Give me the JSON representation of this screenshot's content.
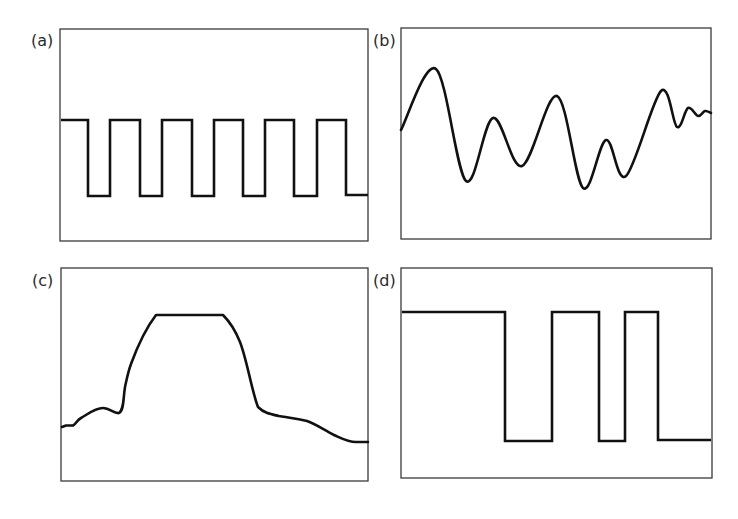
{
  "figure": {
    "colors": {
      "frame": "#3a3a3a",
      "wave": "#111111",
      "background": "#ffffff"
    },
    "panels": [
      {
        "id": "a",
        "label": "(a)",
        "description": "Regular square wave (periodic pulse train)",
        "box": {
          "x": 60,
          "y": 29,
          "w": 308,
          "h": 212
        },
        "label_pos": {
          "x": 31,
          "y": 46
        },
        "style": "step",
        "points": [
          [
            61,
            120
          ],
          [
            88,
            120
          ],
          [
            88,
            196
          ],
          [
            110,
            196
          ],
          [
            110,
            120
          ],
          [
            140,
            120
          ],
          [
            140,
            196
          ],
          [
            162,
            196
          ],
          [
            162,
            120
          ],
          [
            192,
            120
          ],
          [
            192,
            196
          ],
          [
            214,
            196
          ],
          [
            214,
            120
          ],
          [
            243,
            120
          ],
          [
            243,
            196
          ],
          [
            265,
            196
          ],
          [
            265,
            120
          ],
          [
            294,
            120
          ],
          [
            294,
            196
          ],
          [
            317,
            196
          ],
          [
            317,
            120
          ],
          [
            346,
            120
          ],
          [
            346,
            195
          ],
          [
            368,
            195
          ]
        ]
      },
      {
        "id": "b",
        "label": "(b)",
        "description": "Irregular smooth oscillating waveform",
        "box": {
          "x": 401,
          "y": 28,
          "w": 310,
          "h": 211
        },
        "label_pos": {
          "x": 373,
          "y": 46
        },
        "style": "smooth",
        "points": [
          [
            401,
            130
          ],
          [
            436,
            69
          ],
          [
            466,
            181
          ],
          [
            493,
            118
          ],
          [
            522,
            166
          ],
          [
            557,
            96
          ],
          [
            583,
            188
          ],
          [
            606,
            140
          ],
          [
            626,
            176
          ],
          [
            661,
            91
          ],
          [
            677,
            127
          ],
          [
            688,
            108
          ],
          [
            698,
            116
          ],
          [
            705,
            111
          ],
          [
            711,
            113
          ]
        ]
      },
      {
        "id": "c",
        "label": "(c)",
        "description": "Single broad pulse with flat top and noisy baseline",
        "box": {
          "x": 61,
          "y": 268,
          "w": 307,
          "h": 213
        },
        "label_pos": {
          "x": 32,
          "y": 286
        },
        "style": "path",
        "path": "M62,427 L66,425.5 L73,425.5 C76,424 77,420 81,418 C88,414 95,408 103,408 C110,408 114,414 119,413 C124,410 123,400 125,387 C127,378 128,372 131,364 C138,345 146,328 156,315 L223,315 C230,322 236,332 240,342 C247,360 252,392 258,407 C264,413 270,414 279,416 C292,418 300,419 307,421 C316,424 324,430 334,435 C343,439 348,442 356,442 L368,442"
      },
      {
        "id": "d",
        "label": "(d)",
        "description": "Irregular square wave (non-uniform pulse widths)",
        "box": {
          "x": 401,
          "y": 268,
          "w": 311,
          "h": 210
        },
        "label_pos": {
          "x": 373,
          "y": 286
        },
        "style": "step",
        "points": [
          [
            402,
            312
          ],
          [
            505,
            312
          ],
          [
            505,
            441
          ],
          [
            552,
            441
          ],
          [
            552,
            312
          ],
          [
            599,
            312
          ],
          [
            599,
            441
          ],
          [
            625,
            441
          ],
          [
            625,
            312
          ],
          [
            658,
            312
          ],
          [
            658,
            440
          ],
          [
            711,
            440
          ]
        ]
      }
    ]
  }
}
